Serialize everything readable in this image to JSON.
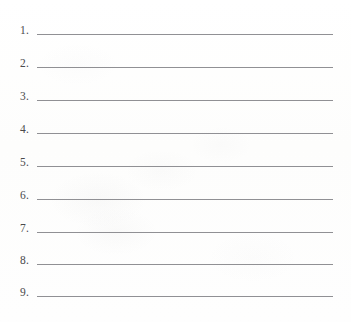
{
  "document": {
    "type": "worksheet",
    "title": "Numbered answer lines",
    "description": "Blank numbered writing lines, items 1 through 9",
    "background_color": "#fefefe",
    "line_color": "#909094",
    "number_color": "#4a4a4c",
    "item_count": 9
  },
  "rows": [
    {
      "number": "1.",
      "value": ""
    },
    {
      "number": "2.",
      "value": ""
    },
    {
      "number": "3.",
      "value": ""
    },
    {
      "number": "4.",
      "value": ""
    },
    {
      "number": "5.",
      "value": ""
    },
    {
      "number": "6.",
      "value": ""
    },
    {
      "number": "7.",
      "value": ""
    },
    {
      "number": "8.",
      "value": ""
    },
    {
      "number": "9.",
      "value": ""
    }
  ]
}
